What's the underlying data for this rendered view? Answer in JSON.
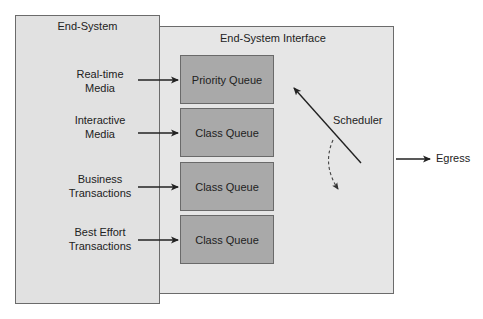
{
  "diagram": {
    "end_system": {
      "title": "End-System"
    },
    "interface": {
      "title": "End-System Interface"
    },
    "flows": [
      {
        "source_line1": "Real-time",
        "source_line2": "Media",
        "queue": "Priority Queue"
      },
      {
        "source_line1": "Interactive",
        "source_line2": "Media",
        "queue": "Class Queue"
      },
      {
        "source_line1": "Business",
        "source_line2": "Transactions",
        "queue": "Class Queue"
      },
      {
        "source_line1": "Best Effort",
        "source_line2": "Transactions",
        "queue": "Class Queue"
      }
    ],
    "scheduler": {
      "label": "Scheduler"
    },
    "egress": {
      "label": "Egress"
    },
    "colors": {
      "end_system_fill": "#e1e1e1",
      "interface_fill": "#e6e6e6",
      "queue_fill": "#a9a9a9",
      "border": "#6b6b6b",
      "arrow": "#222222"
    }
  }
}
